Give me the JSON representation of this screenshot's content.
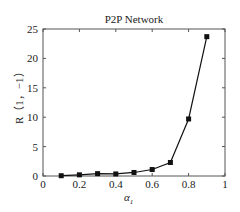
{
  "chart_data": {
    "type": "line",
    "title": "P2P Network",
    "xlabel": "α1",
    "ylabel": "R（1，−1）",
    "x": [
      0.1,
      0.2,
      0.3,
      0.4,
      0.5,
      0.6,
      0.7,
      0.8,
      0.9
    ],
    "series": [
      {
        "name": "R(1,-1)",
        "values": [
          0.05,
          0.2,
          0.4,
          0.35,
          0.6,
          1.1,
          2.3,
          9.7,
          23.7
        ],
        "marker": "square",
        "color": "#111111"
      }
    ],
    "xlim": [
      0,
      1
    ],
    "ylim": [
      0,
      25
    ],
    "xticks": [
      "0",
      "0.2",
      "0.4",
      "0.6",
      "0.8",
      "1"
    ],
    "yticks": [
      "0",
      "5",
      "10",
      "15",
      "20",
      "25"
    ],
    "grid": false,
    "legend": null
  }
}
